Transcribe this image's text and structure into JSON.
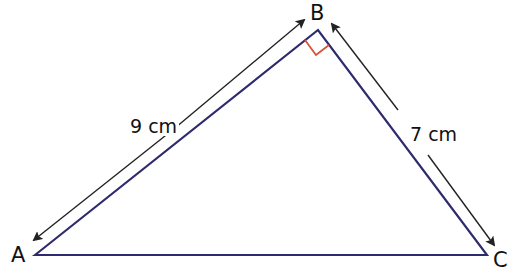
{
  "diagram": {
    "type": "right triangle",
    "vertices": [
      {
        "name": "A",
        "label": "A"
      },
      {
        "name": "B",
        "label": "B"
      },
      {
        "name": "C",
        "label": "C"
      }
    ],
    "right_angle_at": "B",
    "sides": [
      {
        "between": "AB",
        "label": "9 cm"
      },
      {
        "between": "BC",
        "label": "7 cm"
      }
    ],
    "colors": {
      "triangle": "#2e2a6e",
      "right_angle_marker": "#d9533a",
      "arrows": "#222222"
    }
  }
}
